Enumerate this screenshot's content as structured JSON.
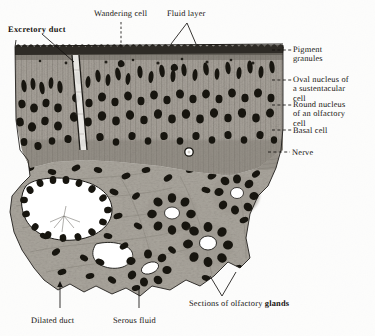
{
  "figure": {
    "medium": "monochrome histological engraving / photomicrograph",
    "background_color": "#fdfdfc",
    "ink_color": "#14120f",
    "tissue_tone_light": "#b8b4ad",
    "tissue_tone_mid": "#8d8880",
    "tissue_tone_dark": "#2a2724",
    "nucleus_color": "#17150f",
    "lumen_color": "#ffffff"
  },
  "labels": {
    "excretory_duct": "Excretory duct",
    "wandering_cell": "Wandering cell",
    "fluid_layer": "Fluid layer",
    "pigment_granules_l1": "Pigment",
    "pigment_granules_l2": "granules",
    "oval_nucleus_l1": "Oval nucleus of",
    "oval_nucleus_l2": "a sustentacular",
    "oval_nucleus_l3": "cell",
    "round_nucleus_l1": "Round nucleus",
    "round_nucleus_l2": "of an olfactory",
    "round_nucleus_l3": "cell",
    "basal_cell": "Basal cell",
    "nerve": "Nerve",
    "dilated_duct": "Dilated duct",
    "serous_fluid": "Serous fluid",
    "sections_glands_normal": "Sections of olfactory ",
    "sections_glands_bold": "glands"
  },
  "features": {
    "epithelium": "tall columnar olfactory epithelium with scalloped free border",
    "glands": "four cross-sections of olfactory (Bowman's) glands with open lumina",
    "duct": "dilated excretory duct lined by dark epithelium",
    "nerve_bundle": "olfactory nerve fibres at right margin",
    "gland_lumen_count": 4,
    "nuclei_count_approx": 150
  }
}
